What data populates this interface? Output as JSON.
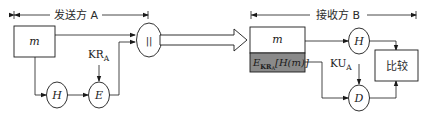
{
  "diagram": {
    "type": "digital-signature-flow",
    "sender": {
      "span_label": "发送方 A",
      "message_box": "m",
      "hash_node": "H",
      "encrypt_node": "E",
      "key_label_main": "KR",
      "key_label_sub": "A",
      "concat_node": "||"
    },
    "receiver": {
      "span_label": "接收方 B",
      "message_box": "m",
      "signature_box": {
        "prefix": "E",
        "sub": "KR",
        "subsub": "A",
        "body": "[H(m)]"
      },
      "hash_node": "H",
      "decrypt_node": "D",
      "key_label_main": "KU",
      "key_label_sub": "A",
      "compare_box": "比较"
    },
    "colors": {
      "line": "#1a1a1a",
      "signature_fill": "#8a8a8a",
      "background": "#ffffff"
    }
  }
}
